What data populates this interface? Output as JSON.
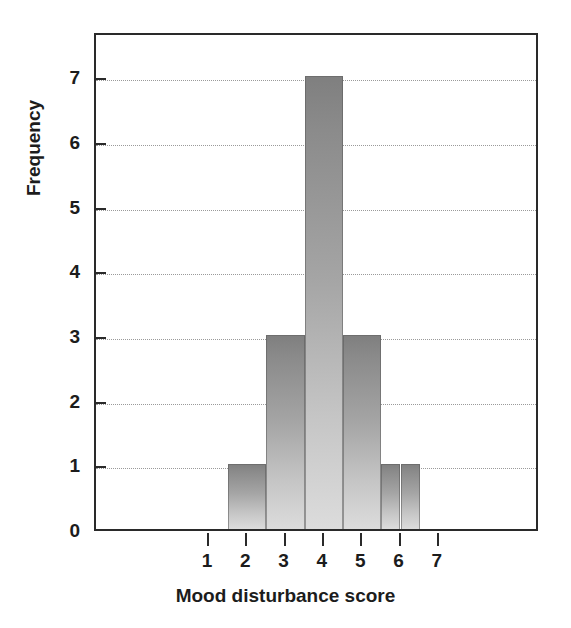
{
  "chart_data": {
    "type": "bar",
    "title": "",
    "xlabel": "Mood disturbance score",
    "ylabel": "Frequency",
    "categories": [
      "1",
      "2",
      "3",
      "4",
      "5",
      "6",
      "7"
    ],
    "values": [
      0,
      1,
      3,
      7,
      3,
      1,
      0
    ],
    "bins": [
      {
        "center": 2,
        "left": 1.5,
        "right": 2.5,
        "frequency": 1
      },
      {
        "center": 3,
        "left": 2.5,
        "right": 3.5,
        "frequency": 3
      },
      {
        "center": 4,
        "left": 3.5,
        "right": 4.5,
        "frequency": 7
      },
      {
        "center": 5,
        "left": 4.5,
        "right": 5.5,
        "frequency": 3
      },
      {
        "center": 5.75,
        "left": 5.5,
        "right": 6.0,
        "frequency": 1
      },
      {
        "center": 6.25,
        "left": 6.0,
        "right": 6.5,
        "frequency": 1
      }
    ],
    "xticks": [
      "1",
      "2",
      "3",
      "4",
      "5",
      "6",
      "7"
    ],
    "yticks": [
      "0",
      "1",
      "2",
      "3",
      "4",
      "5",
      "6",
      "7"
    ],
    "xlim": [
      0,
      8
    ],
    "ylim": [
      0,
      7.7
    ],
    "grid": "horizontal-dotted",
    "legend": "none",
    "bar_color_top": "#7f7f7f",
    "bar_color_bottom": "#dcdcdc",
    "axis_color": "#2a2a2a",
    "grid_color": "#9a9a9a",
    "background": "#ffffff"
  }
}
